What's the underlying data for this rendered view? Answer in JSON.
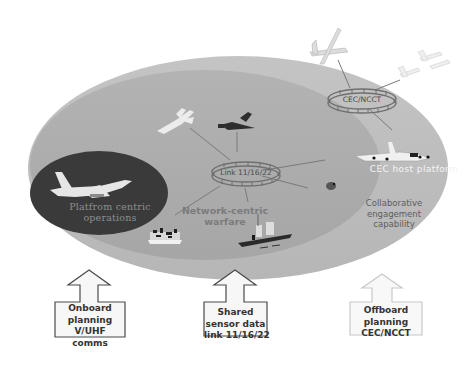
{
  "diagram": {
    "zones": [
      {
        "id": "outer",
        "label": "Collaborative engagement capability",
        "color": "#bdbdbd"
      },
      {
        "id": "middle",
        "label": "Network-centric warfare",
        "color": "#adadad"
      },
      {
        "id": "inner",
        "label": "Platfrom centric operations",
        "color": "#3a3a3a"
      }
    ],
    "labels": {
      "platform_centric_line1": "Platfrom centric",
      "platform_centric_line2": "operations",
      "network_centric_line1": "Network-centric",
      "network_centric_line2": "warfare",
      "cec_host_platform": "CEC host platform",
      "collab_line1": "Collaborative",
      "collab_line2": "engagement",
      "collab_line3": "capability"
    },
    "rings": {
      "link": "Link 11/16/22",
      "cec": "CEC/NCCT"
    },
    "boxes": [
      {
        "lines": [
          "Onboard",
          "planning",
          "V/UHF",
          "comms"
        ]
      },
      {
        "lines": [
          "Shared",
          "sensor data",
          "link 11/16/22"
        ]
      },
      {
        "lines": [
          "Offboard",
          "planning",
          "CEC/NCCT"
        ]
      }
    ],
    "icons": [
      "fighter-jet-icon",
      "aircraft-icon",
      "fighter-icon",
      "uav-icon",
      "aircraft-pair-icon",
      "awacs-aircraft-icon",
      "ground-unit-icon",
      "warship-icon",
      "submarine-icon"
    ]
  }
}
